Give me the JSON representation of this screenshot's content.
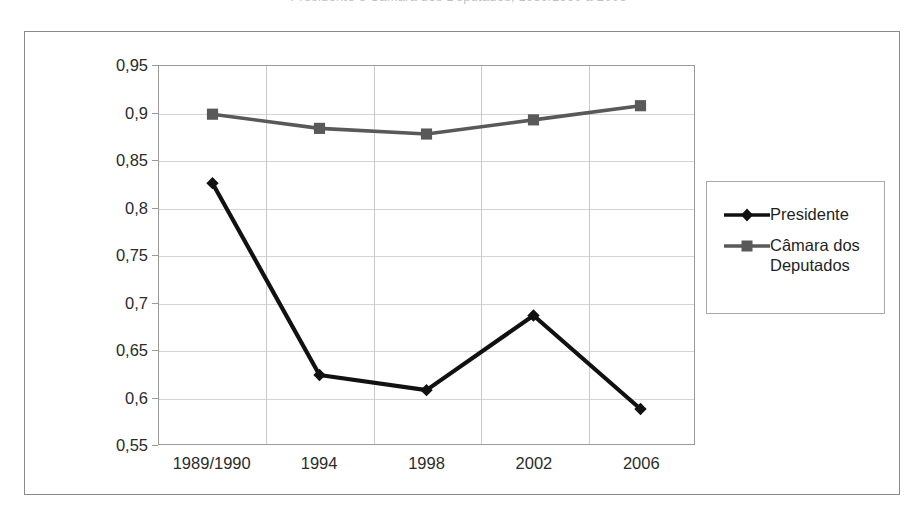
{
  "caption": {
    "text": "Presidente e Câmara dos Deputados, 1989/1990 a 2006"
  },
  "chart_data": {
    "type": "line",
    "title": "",
    "xlabel": "",
    "ylabel": "",
    "categories": [
      "1989/1990",
      "1994",
      "1998",
      "2002",
      "2006"
    ],
    "series": [
      {
        "name": "Presidente",
        "color": "#111111",
        "marker": "diamond",
        "values": [
          0.826,
          0.623,
          0.607,
          0.686,
          0.587
        ]
      },
      {
        "name": "Câmara dos Deputados",
        "color": "#595959",
        "marker": "square",
        "values": [
          0.899,
          0.884,
          0.878,
          0.893,
          0.908
        ]
      }
    ],
    "ylim": [
      0.55,
      0.95
    ],
    "ytick_step": 0.05,
    "ytick_labels": [
      "0,55",
      "0,6",
      "0,65",
      "0,7",
      "0,75",
      "0,8",
      "0,85",
      "0,9",
      "0,95"
    ],
    "ytick_values": [
      0.55,
      0.6,
      0.65,
      0.7,
      0.75,
      0.8,
      0.85,
      0.9,
      0.95
    ],
    "grid": true,
    "legend_position": "right",
    "legend_entries": [
      "Presidente",
      "Câmara dos\nDeputados"
    ]
  }
}
